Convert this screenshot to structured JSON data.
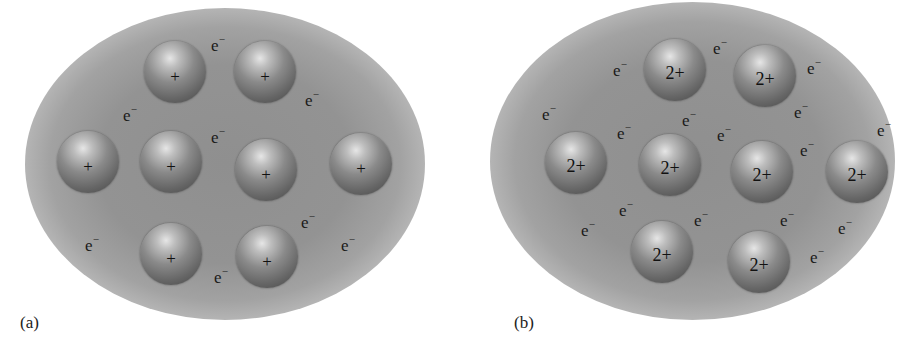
{
  "figure": {
    "panels": [
      {
        "id": "a",
        "caption": "(a)",
        "ion_label": "+",
        "ion_charge": 1,
        "electron_symbol": "e",
        "electron_charge": "−",
        "ions": [
          {
            "x": 175,
            "y": 72
          },
          {
            "x": 265,
            "y": 72
          },
          {
            "x": 88,
            "y": 162
          },
          {
            "x": 171,
            "y": 162
          },
          {
            "x": 266,
            "y": 170
          },
          {
            "x": 361,
            "y": 164
          },
          {
            "x": 171,
            "y": 254
          },
          {
            "x": 267,
            "y": 257
          }
        ],
        "electrons": [
          {
            "x": 218,
            "y": 45
          },
          {
            "x": 312,
            "y": 100
          },
          {
            "x": 130,
            "y": 115
          },
          {
            "x": 218,
            "y": 137
          },
          {
            "x": 308,
            "y": 222
          },
          {
            "x": 92,
            "y": 245
          },
          {
            "x": 221,
            "y": 277
          },
          {
            "x": 348,
            "y": 245
          }
        ]
      },
      {
        "id": "b",
        "caption": "(b)",
        "ion_label": "2+",
        "ion_charge": 2,
        "electron_symbol": "e",
        "electron_charge": "−",
        "ions": [
          {
            "x": 675,
            "y": 70
          },
          {
            "x": 765,
            "y": 76
          },
          {
            "x": 576,
            "y": 163
          },
          {
            "x": 670,
            "y": 165
          },
          {
            "x": 762,
            "y": 172
          },
          {
            "x": 857,
            "y": 172
          },
          {
            "x": 662,
            "y": 252
          },
          {
            "x": 759,
            "y": 262
          }
        ],
        "electrons": [
          {
            "x": 620,
            "y": 70
          },
          {
            "x": 720,
            "y": 48
          },
          {
            "x": 814,
            "y": 68
          },
          {
            "x": 549,
            "y": 114
          },
          {
            "x": 624,
            "y": 133
          },
          {
            "x": 689,
            "y": 120
          },
          {
            "x": 724,
            "y": 135
          },
          {
            "x": 801,
            "y": 112
          },
          {
            "x": 807,
            "y": 150
          },
          {
            "x": 884,
            "y": 130
          },
          {
            "x": 626,
            "y": 210
          },
          {
            "x": 701,
            "y": 220
          },
          {
            "x": 787,
            "y": 220
          },
          {
            "x": 845,
            "y": 228
          },
          {
            "x": 588,
            "y": 230
          },
          {
            "x": 817,
            "y": 257
          }
        ]
      }
    ]
  }
}
